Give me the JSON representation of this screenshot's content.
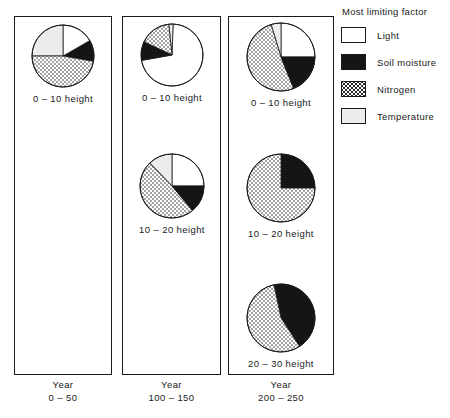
{
  "legend": {
    "title": "Most limiting factor",
    "items": [
      {
        "label": "Light",
        "key": "light",
        "color": "#ffffff",
        "fill": "solid"
      },
      {
        "label": "Soil moisture",
        "key": "soil",
        "color": "#151515",
        "fill": "solid"
      },
      {
        "label": "Nitrogen",
        "key": "nitrogen",
        "color": "#ffffff",
        "fill": "dotted"
      },
      {
        "label": "Temperature",
        "key": "temp",
        "color": "#ececec",
        "fill": "solid"
      }
    ]
  },
  "chart_data": {
    "type": "pie",
    "title": "Most limiting factor",
    "legend_position": "right",
    "grid": false,
    "categories": [
      "Light",
      "Soil moisture",
      "Nitrogen",
      "Temperature"
    ],
    "colors": [
      "#ffffff",
      "#151515",
      "#ffffff",
      "#ececec"
    ],
    "panels": [
      {
        "caption_line1": "Year",
        "caption_line2": "0 – 50",
        "pies": [
          {
            "label": "0 – 10 height",
            "slices": [
              {
                "name": "Soil moisture",
                "key": "soil",
                "start": 350,
                "end": 390,
                "value": 11
              },
              {
                "name": "Light",
                "key": "light",
                "start": 30,
                "end": 90,
                "value": 17
              },
              {
                "name": "Temperature",
                "key": "temp",
                "start": 90,
                "end": 180,
                "value": 25
              },
              {
                "name": "Nitrogen",
                "key": "nitrogen",
                "start": 180,
                "end": 350,
                "value": 47
              }
            ]
          }
        ]
      },
      {
        "caption_line1": "Year",
        "caption_line2": "100 – 150",
        "pies": [
          {
            "label": "0 – 10 height",
            "slices": [
              {
                "name": "Light",
                "key": "light",
                "start": 190,
                "end": 448,
                "value": 72
              },
              {
                "name": "Temperature",
                "key": "temp",
                "start": 88,
                "end": 96,
                "value": 2
              },
              {
                "name": "Nitrogen",
                "key": "nitrogen",
                "start": 96,
                "end": 155,
                "value": 16
              },
              {
                "name": "Soil moisture",
                "key": "soil",
                "start": 155,
                "end": 190,
                "value": 10
              }
            ]
          },
          {
            "label": "10 – 20 height",
            "slices": [
              {
                "name": "Light",
                "key": "light",
                "start": 0,
                "end": 90,
                "value": 25
              },
              {
                "name": "Temperature",
                "key": "temp",
                "start": 90,
                "end": 134,
                "value": 12
              },
              {
                "name": "Nitrogen",
                "key": "nitrogen",
                "start": 134,
                "end": 310,
                "value": 49
              },
              {
                "name": "Soil moisture",
                "key": "soil",
                "start": 310,
                "end": 360,
                "value": 14
              }
            ]
          }
        ]
      },
      {
        "caption_line1": "Year",
        "caption_line2": "200 – 250",
        "pies": [
          {
            "label": "0 – 10 height",
            "slices": [
              {
                "name": "Light",
                "key": "light",
                "start": 0,
                "end": 90,
                "value": 25
              },
              {
                "name": "Temperature",
                "key": "temp",
                "start": 90,
                "end": 107,
                "value": 5
              },
              {
                "name": "Nitrogen",
                "key": "nitrogen",
                "start": 107,
                "end": 292,
                "value": 51
              },
              {
                "name": "Soil moisture",
                "key": "soil",
                "start": 292,
                "end": 360,
                "value": 19
              }
            ]
          },
          {
            "label": "10 – 20 height",
            "slices": [
              {
                "name": "Soil moisture",
                "key": "soil",
                "start": 0,
                "end": 90,
                "value": 25
              },
              {
                "name": "Nitrogen",
                "key": "nitrogen",
                "start": 90,
                "end": 360,
                "value": 75
              }
            ]
          },
          {
            "label": "20 – 30 height",
            "slices": [
              {
                "name": "Soil moisture",
                "key": "soil",
                "start": 303,
                "end": 462,
                "value": 44
              },
              {
                "name": "Nitrogen",
                "key": "nitrogen",
                "start": 102,
                "end": 303,
                "value": 56
              }
            ]
          }
        ]
      }
    ]
  },
  "layout": {
    "panels": [
      {
        "x": 14,
        "y": 16,
        "w": 98,
        "h": 359,
        "caption_x": 14,
        "caption_y": 379,
        "caption_w": 98
      },
      {
        "x": 122,
        "y": 16,
        "w": 99,
        "h": 359,
        "caption_x": 122,
        "caption_y": 379,
        "caption_w": 99
      },
      {
        "x": 228,
        "y": 16,
        "w": 106,
        "h": 359,
        "caption_x": 228,
        "caption_y": 379,
        "caption_w": 106
      }
    ],
    "pies": [
      [
        {
          "cx": 63,
          "cy": 56,
          "r": 31
        }
      ],
      [
        {
          "cx": 172,
          "cy": 55,
          "r": 31
        },
        {
          "cx": 172,
          "cy": 186,
          "r": 32
        }
      ],
      [
        {
          "cx": 281,
          "cy": 57,
          "r": 34
        },
        {
          "cx": 281,
          "cy": 188,
          "r": 34
        },
        {
          "cx": 281,
          "cy": 318,
          "r": 34
        }
      ]
    ]
  }
}
